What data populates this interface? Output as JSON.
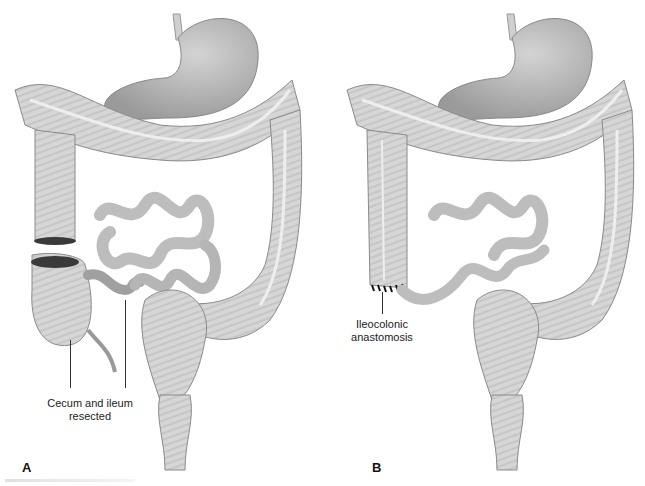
{
  "figure": {
    "panels": [
      {
        "id": "A",
        "label": "A",
        "description": "Before: cecum and terminal ileum resected from colon",
        "callouts": [
          {
            "text_line1": "Cecum and ileum",
            "text_line2": "resected"
          }
        ]
      },
      {
        "id": "B",
        "label": "B",
        "description": "After: ileum joined to ascending colon",
        "callouts": [
          {
            "text_line1": "Ileocolonic",
            "text_line2": "anastomosis"
          }
        ]
      }
    ],
    "structures": [
      "stomach",
      "esophagus",
      "transverse colon",
      "ascending colon",
      "descending colon",
      "sigmoid colon",
      "rectum",
      "small intestine",
      "cecum",
      "appendix"
    ],
    "colors": {
      "organ_fill": "#d8d8d8",
      "organ_shadow": "#a9a9a9",
      "organ_outline": "#8a8a8a",
      "stomach_fill": "#bdbdbd",
      "cut_edge": "#3a3a3a",
      "suture": "#111111"
    }
  }
}
